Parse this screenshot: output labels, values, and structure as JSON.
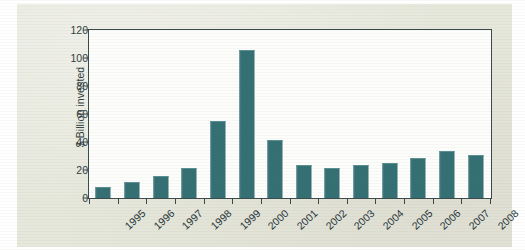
{
  "figure": {
    "paper_background": "#e7e8dc",
    "plot_background": "#fdfdfb",
    "axis_color": "#39484a",
    "bar_color": "#336f73"
  },
  "chart_data": {
    "type": "bar",
    "title": "",
    "xlabel": "",
    "ylabel": "$ Billion invested",
    "categories": [
      "1995",
      "1996",
      "1997",
      "1998",
      "1999",
      "2000",
      "2001",
      "2002",
      "2003",
      "2004",
      "2005",
      "2006",
      "2007",
      "2008"
    ],
    "values": [
      7.5,
      11,
      15,
      21,
      54,
      105,
      41,
      23,
      21,
      23,
      24,
      28,
      33,
      30
    ],
    "ylim": [
      0,
      120
    ],
    "yticks": [
      0,
      20,
      40,
      60,
      80,
      100,
      120
    ],
    "ytick_labels": [
      "0",
      "20",
      "40",
      "60",
      "80",
      "100",
      "120"
    ],
    "grid": false,
    "legend": null,
    "xlabel_rotation": -43
  }
}
